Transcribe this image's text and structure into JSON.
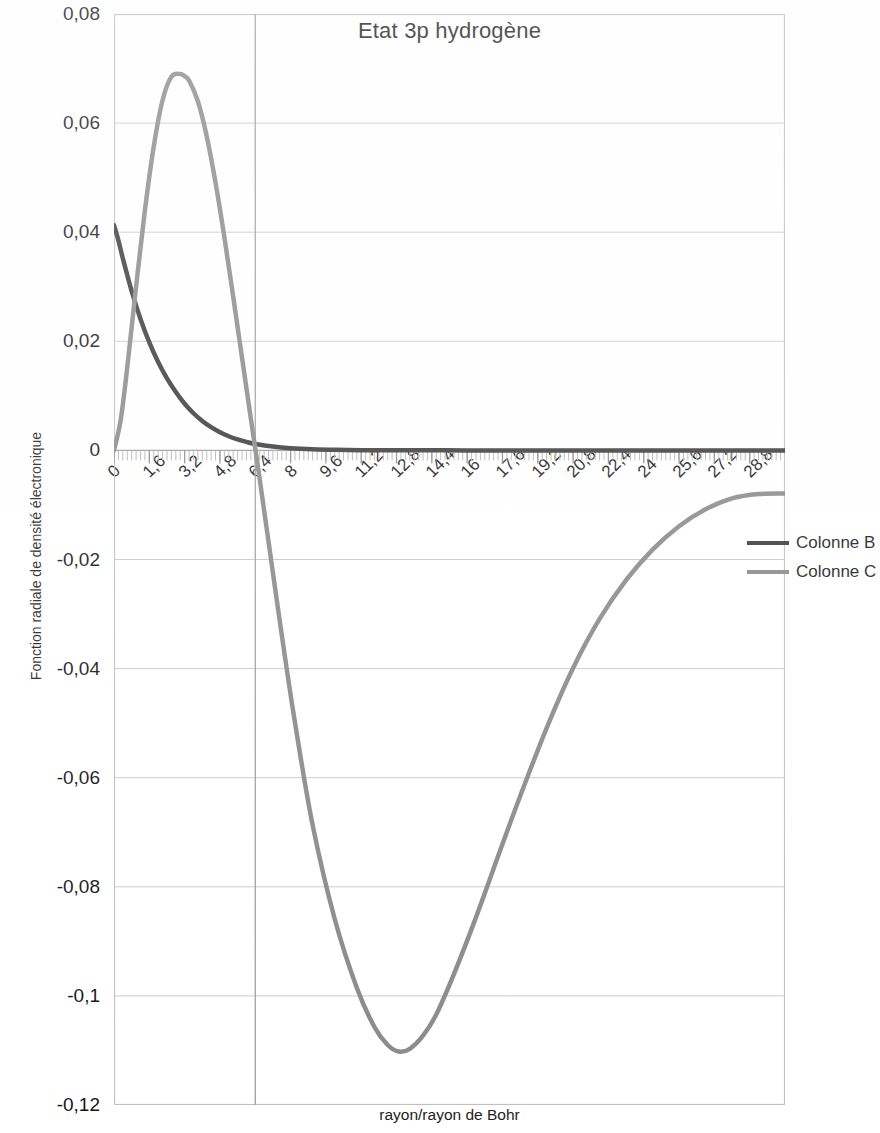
{
  "chart_data": {
    "type": "line",
    "title": "Etat 3p hydrogène",
    "xlabel": "rayon/rayon de Bohr",
    "ylabel": "Fonction radiale de densité électronique",
    "xlim": [
      0,
      30.4
    ],
    "ylim": [
      -0.12,
      0.08
    ],
    "grid": "horizontal",
    "legend_position": "right",
    "y_ticks": [
      "0,08",
      "0,06",
      "0,04",
      "0,02",
      "0",
      "-0,02",
      "-0,04",
      "-0,06",
      "-0,08",
      "-0,1",
      "-0,12"
    ],
    "y_tick_values": [
      0.08,
      0.06,
      0.04,
      0.02,
      0,
      -0.02,
      -0.04,
      -0.06,
      -0.08,
      -0.1,
      -0.12
    ],
    "x_ticks": [
      "0",
      "1,6",
      "3,2",
      "4,8",
      "6,4",
      "8",
      "9,6",
      "11,2",
      "12,8",
      "14,4",
      "16",
      "17,6",
      "19,2",
      "20,8",
      "22,4",
      "24",
      "25,6",
      "27,2",
      "28,8"
    ],
    "x_tick_values": [
      0,
      1.6,
      3.2,
      4.8,
      6.4,
      8,
      9.6,
      11.2,
      12.8,
      14.4,
      16,
      17.6,
      19.2,
      20.8,
      22.4,
      24,
      25.6,
      27.2,
      28.8
    ],
    "series": [
      {
        "name": "Colonne B",
        "color": "#3a3a3a",
        "width": 4.5,
        "x": [
          0,
          0.2,
          0.4,
          0.8,
          1.2,
          1.6,
          2.0,
          2.4,
          2.8,
          3.2,
          3.6,
          4.0,
          4.4,
          4.8,
          5.2,
          5.6,
          6.0,
          6.4,
          7.2,
          8.0,
          9.0,
          10.0,
          11.2,
          12.8,
          14.4,
          16.0,
          18.0,
          20.0,
          22.4,
          24.0,
          26.0,
          28.0,
          30.4
        ],
        "values": [
          0.0413,
          0.0385,
          0.0352,
          0.0292,
          0.0241,
          0.0198,
          0.0162,
          0.0132,
          0.0107,
          0.00855,
          0.00681,
          0.0054,
          0.00425,
          0.00333,
          0.0026,
          0.00201,
          0.00155,
          0.00119,
          0.0007,
          0.0004,
          0.0002,
          0.0001,
          5e-05,
          2e-05,
          1e-05,
          4e-06,
          1e-06,
          5e-07,
          2e-07,
          1e-07,
          5e-08,
          2e-08,
          1e-08
        ]
      },
      {
        "name": "Colonne C",
        "color": "#8a8a8a",
        "width": 4.5,
        "x": [
          0,
          0.3,
          0.6,
          1.0,
          1.4,
          1.8,
          2.2,
          2.6,
          3.0,
          3.2,
          3.4,
          3.8,
          4.2,
          4.6,
          5.0,
          5.4,
          5.8,
          6.2,
          6.5,
          7.0,
          7.6,
          8.2,
          9.0,
          10.0,
          11.0,
          11.8,
          12.4,
          12.9,
          13.4,
          14.0,
          14.6,
          15.4,
          16.4,
          17.4,
          18.4,
          19.6,
          20.8,
          22.0,
          23.2,
          24.4,
          25.6,
          26.8,
          28.0,
          29.2,
          30.4
        ],
        "values": [
          0.0,
          0.0055,
          0.0152,
          0.03,
          0.044,
          0.0557,
          0.0642,
          0.0685,
          0.069,
          0.0686,
          0.0678,
          0.064,
          0.0576,
          0.0491,
          0.0391,
          0.0282,
          0.017,
          0.0058,
          -0.0024,
          -0.0167,
          -0.0338,
          -0.0499,
          -0.0687,
          -0.0859,
          -0.0985,
          -0.1057,
          -0.109,
          -0.1102,
          -0.1097,
          -0.1073,
          -0.1034,
          -0.096,
          -0.0856,
          -0.0744,
          -0.0634,
          -0.0509,
          -0.0399,
          -0.0309,
          -0.0238,
          -0.0182,
          -0.0139,
          -0.0108,
          -0.0088,
          -0.008,
          -0.0079
        ]
      }
    ]
  },
  "legend": {
    "items": [
      {
        "label": "Colonne B",
        "color": "#3a3a3a"
      },
      {
        "label": "Colonne C",
        "color": "#8a8a8a"
      }
    ]
  }
}
